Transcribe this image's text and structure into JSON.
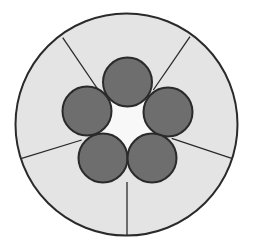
{
  "diagram": {
    "colors": {
      "background": "#ffffff",
      "sector_fill": "#e4e4e4",
      "strand_fill": "#6e6e6e",
      "core_fill": "#f8f8f8",
      "stroke": "#2a2a2a"
    },
    "outer_circle": {
      "cx": 126.5,
      "cy": 124.5,
      "r": 111
    },
    "core": {
      "cx": 127,
      "cy": 121,
      "r": 30
    },
    "strands": [
      {
        "id": "top",
        "cx": 127.5,
        "cy": 82,
        "r": 24.5
      },
      {
        "id": "left",
        "cx": 87,
        "cy": 111,
        "r": 24.5
      },
      {
        "id": "right",
        "cx": 168,
        "cy": 112,
        "r": 24.5
      },
      {
        "id": "bottom-left",
        "cx": 103,
        "cy": 158,
        "r": 24.5
      },
      {
        "id": "bottom-right",
        "cx": 152,
        "cy": 158,
        "r": 24.5
      }
    ],
    "dividers": [
      {
        "id": "top-left",
        "x1": 101.7,
        "y1": 95,
        "x2": 62.7,
        "y2": 37.7
      },
      {
        "id": "top-right",
        "x1": 153.3,
        "y1": 90,
        "x2": 190,
        "y2": 36.7
      },
      {
        "id": "bottom-left",
        "x1": 81.7,
        "y1": 140,
        "x2": 21.7,
        "y2": 158.3
      },
      {
        "id": "bottom-right",
        "x1": 171.7,
        "y1": 138.3,
        "x2": 231.7,
        "y2": 158.3
      },
      {
        "id": "bottom",
        "x1": 127,
        "y1": 182,
        "x2": 127,
        "y2": 235
      }
    ]
  }
}
